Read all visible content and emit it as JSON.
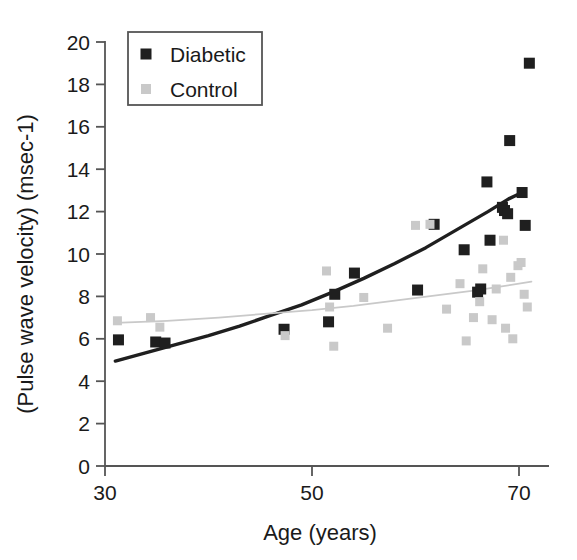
{
  "chart_data": {
    "type": "scatter",
    "title": "",
    "xlabel": "Age (years)",
    "ylabel": "(Pulse wave velocity) (msec-1)",
    "xlim": [
      30,
      71.5
    ],
    "ylim": [
      0,
      20
    ],
    "xticks": [
      30,
      50,
      70
    ],
    "yticks": [
      0,
      2,
      4,
      6,
      8,
      10,
      12,
      14,
      16,
      18,
      20
    ],
    "grid": false,
    "legend_position": "top-left",
    "series": [
      {
        "name": "Diabetic",
        "color": "#1f1f1f",
        "marker": "square",
        "points": [
          [
            31.3,
            5.95
          ],
          [
            34.9,
            5.85
          ],
          [
            35.8,
            5.8
          ],
          [
            47.3,
            6.45
          ],
          [
            51.6,
            6.8
          ],
          [
            52.2,
            8.1
          ],
          [
            54.1,
            9.1
          ],
          [
            60.2,
            8.3
          ],
          [
            61.8,
            11.4
          ],
          [
            64.7,
            10.2
          ],
          [
            66.0,
            8.2
          ],
          [
            66.3,
            8.35
          ],
          [
            66.9,
            13.4
          ],
          [
            67.2,
            10.65
          ],
          [
            68.4,
            12.2
          ],
          [
            68.6,
            12.05
          ],
          [
            68.9,
            11.9
          ],
          [
            69.1,
            15.35
          ],
          [
            70.3,
            12.9
          ],
          [
            70.6,
            11.35
          ],
          [
            71.0,
            19.0
          ]
        ]
      },
      {
        "name": "Control",
        "color": "#c9c9c9",
        "marker": "square",
        "points": [
          [
            31.2,
            6.85
          ],
          [
            34.4,
            7.0
          ],
          [
            35.3,
            6.55
          ],
          [
            47.4,
            6.15
          ],
          [
            51.4,
            9.2
          ],
          [
            51.7,
            7.5
          ],
          [
            52.1,
            5.65
          ],
          [
            55.0,
            7.95
          ],
          [
            57.3,
            6.5
          ],
          [
            60.0,
            11.35
          ],
          [
            61.4,
            11.4
          ],
          [
            63.0,
            7.4
          ],
          [
            64.3,
            8.6
          ],
          [
            64.9,
            5.9
          ],
          [
            65.6,
            7.0
          ],
          [
            66.2,
            7.75
          ],
          [
            66.5,
            9.3
          ],
          [
            67.4,
            6.9
          ],
          [
            67.8,
            8.35
          ],
          [
            68.5,
            10.65
          ],
          [
            68.7,
            6.5
          ],
          [
            69.2,
            8.9
          ],
          [
            69.4,
            6.0
          ],
          [
            69.9,
            9.45
          ],
          [
            70.2,
            9.6
          ],
          [
            70.5,
            8.1
          ],
          [
            70.8,
            7.5
          ]
        ]
      }
    ],
    "trend_lines": [
      {
        "name": "Diabetic fit",
        "color": "#1f1f1f",
        "width": 3.4,
        "points": [
          [
            31.0,
            4.95
          ],
          [
            34.0,
            5.35
          ],
          [
            37.0,
            5.75
          ],
          [
            40.0,
            6.15
          ],
          [
            43.0,
            6.6
          ],
          [
            46.0,
            7.1
          ],
          [
            49.0,
            7.6
          ],
          [
            52.0,
            8.2
          ],
          [
            55.0,
            8.85
          ],
          [
            58.0,
            9.55
          ],
          [
            61.0,
            10.3
          ],
          [
            64.0,
            11.15
          ],
          [
            67.0,
            12.0
          ],
          [
            69.0,
            12.6
          ],
          [
            70.3,
            12.9
          ]
        ]
      },
      {
        "name": "Control fit",
        "color": "#c9c9c9",
        "width": 1.8,
        "points": [
          [
            31.0,
            6.75
          ],
          [
            36.0,
            6.85
          ],
          [
            41.0,
            7.0
          ],
          [
            46.0,
            7.2
          ],
          [
            50.0,
            7.35
          ],
          [
            54.0,
            7.55
          ],
          [
            58.0,
            7.8
          ],
          [
            62.0,
            8.05
          ],
          [
            66.0,
            8.3
          ],
          [
            68.0,
            8.45
          ],
          [
            70.0,
            8.6
          ],
          [
            71.2,
            8.7
          ]
        ]
      }
    ],
    "legend": [
      {
        "label": "Diabetic",
        "color": "#1f1f1f"
      },
      {
        "label": "Control",
        "color": "#c9c9c9"
      }
    ]
  }
}
